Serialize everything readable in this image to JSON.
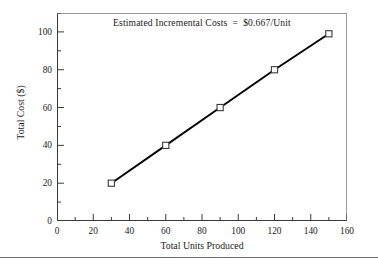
{
  "chart_data": {
    "type": "line",
    "title": "",
    "annotation": "Estimated Incremental Costs  =  $0.667/Unit",
    "xlabel": "Total Units Produced",
    "ylabel": "Total Cost ($)",
    "xlim": [
      0,
      160
    ],
    "ylim": [
      0,
      110
    ],
    "xticks": [
      0,
      20,
      40,
      60,
      80,
      100,
      120,
      140,
      160
    ],
    "xticklabels": [
      "0",
      "20",
      "40",
      "60",
      "80",
      "100",
      "120",
      "140",
      "160"
    ],
    "yticks": [
      0,
      20,
      40,
      60,
      80,
      100
    ],
    "yticklabels": [
      "0",
      "20",
      "40",
      "60",
      "80",
      "100"
    ],
    "x_minor_step": 10,
    "y_minor_step": 10,
    "grid": false,
    "legend": false,
    "x": [
      30,
      60,
      90,
      120,
      150
    ],
    "values": [
      20,
      40,
      60,
      80,
      99
    ],
    "series": [
      {
        "name": "Total Cost",
        "x": [
          30,
          60,
          90,
          120,
          150
        ],
        "values": [
          20,
          40,
          60,
          80,
          99
        ],
        "line_color": "#000000",
        "marker": "open-square",
        "marker_face_color": "#ffffff",
        "marker_edge_color": "#3a3a3a"
      }
    ],
    "slope_per_unit": 0.667,
    "slope_units": "$/Unit"
  },
  "figure": {
    "background_color": "#ffffff",
    "frame_color": "#9a9a9a",
    "axis_color": "#3a3a3a",
    "text_color": "#1a1a1a",
    "bottom_rule_color": "#6f6f6f"
  }
}
